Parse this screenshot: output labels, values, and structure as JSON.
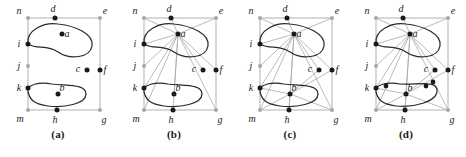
{
  "figure": {
    "type": "diagram-series",
    "panel_count": 4
  },
  "geometry": {
    "frame": {
      "left": 28,
      "right": 100,
      "top": 18,
      "bottom": 110
    },
    "vertices": [
      {
        "id": "n",
        "x": 28,
        "y": 18,
        "fill": "grey",
        "label_dx": -9,
        "label_dy": -4
      },
      {
        "id": "d",
        "x": 55,
        "y": 18,
        "fill": "black",
        "label_dx": -2,
        "label_dy": -6
      },
      {
        "id": "e",
        "x": 100,
        "y": 18,
        "fill": "grey",
        "label_dx": 5,
        "label_dy": -4
      },
      {
        "id": "i",
        "x": 28,
        "y": 44,
        "fill": "black",
        "label_dx": -9,
        "label_dy": 3
      },
      {
        "id": "j",
        "x": 28,
        "y": 66,
        "fill": "grey",
        "label_dx": -9,
        "label_dy": 3
      },
      {
        "id": "k",
        "x": 28,
        "y": 88,
        "fill": "black",
        "label_dx": -9,
        "label_dy": 3
      },
      {
        "id": "m",
        "x": 28,
        "y": 110,
        "fill": "grey",
        "label_dx": -8,
        "label_dy": 12
      },
      {
        "id": "h",
        "x": 57,
        "y": 110,
        "fill": "black",
        "label_dx": -2,
        "label_dy": 13
      },
      {
        "id": "g",
        "x": 100,
        "y": 110,
        "fill": "grey",
        "label_dx": 4,
        "label_dy": 13
      },
      {
        "id": "f",
        "x": 100,
        "y": 70,
        "fill": "black",
        "label_dx": 5,
        "label_dy": 3
      },
      {
        "id": "c",
        "x": 87,
        "y": 70,
        "fill": "black",
        "label_dx": -9,
        "label_dy": 2
      },
      {
        "id": "a",
        "x": 62,
        "y": 34,
        "fill": "black",
        "label_dx": 5,
        "label_dy": 3
      },
      {
        "id": "b",
        "x": 58,
        "y": 94,
        "fill": "black",
        "label_dx": 4,
        "label_dy": -3
      }
    ],
    "extra_vertices_panel_d": [
      {
        "id": "p1",
        "x": 38,
        "y": 86,
        "fill": "black"
      },
      {
        "id": "p2",
        "x": 78,
        "y": 86,
        "fill": "black"
      },
      {
        "id": "p3",
        "x": 85,
        "y": 82,
        "fill": "black"
      }
    ],
    "blob_a_path": "M28,44 C26,30 44,22 58,24 C76,26 94,34 92,46 C90,58 70,60 58,52 C46,44 38,50 28,44 Z",
    "blob_b_path": "M28,92 C26,84 40,82 52,84 C68,86 86,84 86,94 C86,104 64,108 48,106 C34,104 30,100 28,92 Z",
    "blob_b_path_d": "M28,92 C26,84 40,82 52,84 C70,85 88,80 89,90 C90,102 64,108 48,106 C34,104 30,100 28,92 Z"
  },
  "panels": [
    {
      "caption": "(a)",
      "name": "panel-a",
      "frame_edges": [
        "n-e",
        "n-m",
        "m-g",
        "e-g"
      ],
      "grey_edges": [],
      "show_blob_a": true,
      "show_blob_b": true,
      "extra_vertices": false
    },
    {
      "caption": "(b)",
      "name": "panel-b",
      "frame_edges": [
        "n-e",
        "n-m",
        "m-g",
        "e-g"
      ],
      "grey_edges": [
        "a-n",
        "a-d",
        "a-e",
        "a-i",
        "a-j",
        "a-k",
        "a-m",
        "a-h",
        "a-g",
        "a-c",
        "a-f",
        "a-b"
      ],
      "show_blob_a": true,
      "show_blob_b": true,
      "extra_vertices": false
    },
    {
      "caption": "(c)",
      "name": "panel-c",
      "frame_edges": [
        "n-e",
        "n-m",
        "m-g",
        "e-g"
      ],
      "grey_edges": [
        "a-n",
        "a-d",
        "a-e",
        "a-i",
        "a-j",
        "a-k",
        "a-m",
        "a-h",
        "a-g",
        "a-c",
        "a-f",
        "a-b",
        "b-k",
        "b-m",
        "b-h",
        "b-g",
        "b-c",
        "b-f"
      ],
      "show_blob_a": true,
      "show_blob_b": true,
      "extra_vertices": false
    },
    {
      "caption": "(d)",
      "name": "panel-d",
      "frame_edges": [
        "n-e",
        "n-m",
        "m-g",
        "e-g"
      ],
      "grey_edges": [
        "a-n",
        "a-d",
        "a-e",
        "a-i",
        "a-j",
        "a-k",
        "a-m",
        "a-h",
        "a-g",
        "a-c",
        "a-f",
        "a-b",
        "b-k",
        "b-m",
        "b-h",
        "b-g",
        "b-c",
        "b-f"
      ],
      "show_blob_a": true,
      "show_blob_b": true,
      "extra_vertices": true
    }
  ],
  "colors": {
    "black": "#1a1a1a",
    "grey": "#a8a8a8",
    "blob_stroke": "#2a2a2a",
    "background": "#ffffff"
  }
}
